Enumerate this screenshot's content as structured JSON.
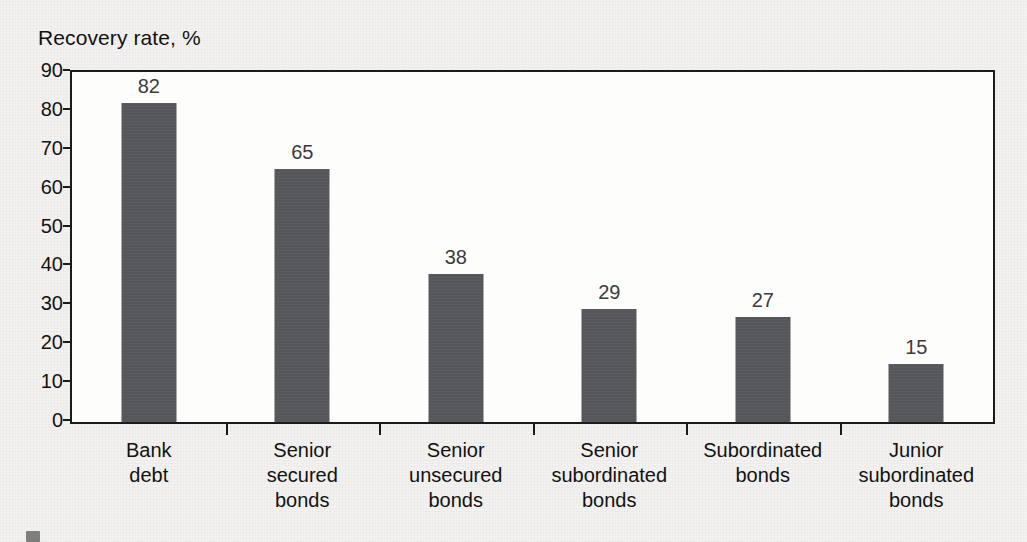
{
  "chart_data": {
    "type": "bar",
    "title": "Recovery rate, %",
    "xlabel": "",
    "ylabel": "",
    "ylim": [
      0,
      90
    ],
    "grid": false,
    "legend": false,
    "bar_color": "#55565a",
    "plot_background": "#fdfdfc",
    "page_background": "#e9e7e4",
    "y_ticks": [
      90,
      80,
      70,
      60,
      50,
      40,
      30,
      20,
      10,
      0
    ],
    "categories": [
      "Bank debt",
      "Senior secured bonds",
      "Senior unsecured bonds",
      "Senior subordinated bonds",
      "Subordinated bonds",
      "Junior subordinated bonds"
    ],
    "category_lines": [
      [
        "Bank",
        "debt"
      ],
      [
        "Senior",
        "secured",
        "bonds"
      ],
      [
        "Senior",
        "unsecured",
        "bonds"
      ],
      [
        "Senior",
        "subordinated",
        "bonds"
      ],
      [
        "Subordinated",
        "bonds"
      ],
      [
        "Junior",
        "subordinated",
        "bonds"
      ]
    ],
    "values": [
      82,
      65,
      38,
      29,
      27,
      15
    ],
    "value_labels": [
      "82",
      "65",
      "38",
      "29",
      "27",
      "15"
    ]
  }
}
